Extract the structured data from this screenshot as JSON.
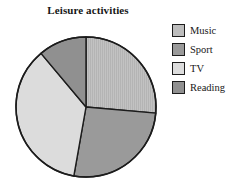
{
  "chart_data": {
    "type": "pie",
    "title": "Leisure activities",
    "xlabel": "",
    "ylabel": "",
    "legend_position": "right",
    "grid": false,
    "categories": [
      "Music",
      "Sport",
      "TV",
      "Reading"
    ],
    "values": [
      26,
      26,
      36,
      12
    ],
    "unit": "percent",
    "start_angle_deg": 0,
    "direction": "clockwise",
    "slices": [
      {
        "label": "Music",
        "value": 26,
        "start_angle_deg": 0,
        "end_angle_deg": 95,
        "color": "#bdbdbd",
        "texture": "fine-vertical-lines"
      },
      {
        "label": "Sport",
        "value": 26,
        "start_angle_deg": 95,
        "end_angle_deg": 190,
        "color": "#9a9a9a",
        "texture": "solid"
      },
      {
        "label": "TV",
        "value": 36,
        "start_angle_deg": 190,
        "end_angle_deg": 320,
        "color": "#dcdcdc",
        "texture": "solid"
      },
      {
        "label": "Reading",
        "value": 12,
        "start_angle_deg": 320,
        "end_angle_deg": 360,
        "color": "#909090",
        "texture": "solid"
      }
    ],
    "geometry": {
      "center_x": 86,
      "center_y": 107,
      "radius": 70,
      "outline_color": "#1c1c1c"
    }
  },
  "legend": {
    "items": [
      {
        "label": "Music",
        "color": "#bdbdbd"
      },
      {
        "label": "Sport",
        "color": "#9a9a9a"
      },
      {
        "label": "TV",
        "color": "#dcdcdc"
      },
      {
        "label": "Reading",
        "color": "#909090"
      }
    ]
  }
}
